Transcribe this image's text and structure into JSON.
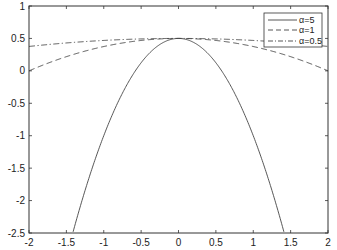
{
  "chart_data": {
    "type": "line",
    "title": "",
    "xlabel": "",
    "ylabel": "",
    "xlim": [
      -2,
      2
    ],
    "ylim": [
      -2.5,
      1
    ],
    "xticks": [
      -2,
      -1.5,
      -1,
      -0.5,
      0,
      0.5,
      1,
      1.5,
      2
    ],
    "yticks": [
      -2.5,
      -2,
      -1.5,
      -1,
      -0.5,
      0,
      0.5,
      1
    ],
    "xtick_labels": [
      "-2",
      "-1.5",
      "-1",
      "-0.5",
      "0",
      "0.5",
      "1",
      "1.5",
      "2"
    ],
    "ytick_labels": [
      "-2.5",
      "-2",
      "-1.5",
      "-1",
      "-0.5",
      "0",
      "0.5",
      "1"
    ],
    "grid": false,
    "legend_position": "upper right",
    "x": [
      -2,
      -1.5,
      -1.414,
      -1,
      -0.5,
      0,
      0.5,
      1,
      1.414,
      1.5,
      2
    ],
    "series": [
      {
        "name": "α=5",
        "style": "solid",
        "values": [
          null,
          null,
          -2.5,
          -1.0,
          0.125,
          0.5,
          0.125,
          -1.0,
          -2.5,
          null,
          null
        ]
      },
      {
        "name": "α=1",
        "style": "dashed",
        "values": [
          0.0,
          0.219,
          0.25,
          0.375,
          0.469,
          0.5,
          0.469,
          0.375,
          0.25,
          0.219,
          0.0
        ]
      },
      {
        "name": "α=0.5",
        "style": "dashdot",
        "values": [
          0.375,
          0.43,
          0.4375,
          0.469,
          0.492,
          0.5,
          0.492,
          0.469,
          0.4375,
          0.43,
          0.375
        ]
      }
    ]
  },
  "legend": {
    "items": [
      {
        "label": "α=5"
      },
      {
        "label": "α=1"
      },
      {
        "label": "α=0.5"
      }
    ]
  }
}
